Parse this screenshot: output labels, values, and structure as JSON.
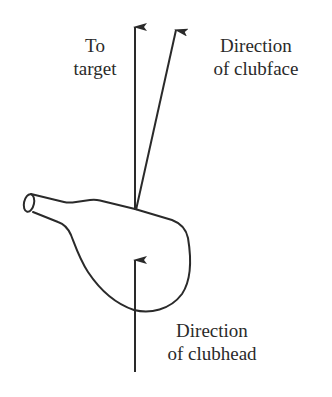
{
  "diagram": {
    "labels": {
      "to_target": [
        "To",
        "target"
      ],
      "direction_of_clubface": [
        "Direction",
        "of clubface"
      ],
      "direction_of_clubhead": [
        "Direction",
        "of clubhead"
      ]
    },
    "arrows": [
      {
        "name": "to-target-arrow",
        "from": [
          135,
          210
        ],
        "to": [
          135,
          25
        ]
      },
      {
        "name": "clubface-direction-arrow",
        "from": [
          136,
          210
        ],
        "to": [
          176,
          28
        ]
      },
      {
        "name": "clubhead-direction-arrow",
        "from": [
          135,
          372
        ],
        "to": [
          135,
          258
        ]
      }
    ],
    "colors": {
      "stroke": "#2a2a2a",
      "background": "#ffffff"
    }
  }
}
